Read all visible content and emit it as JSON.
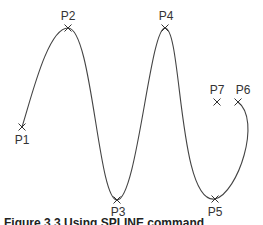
{
  "figure": {
    "caption": "Figure 3.3  Using SPLINE command",
    "curve_color": "#444444",
    "marker_color": "#333333",
    "points": [
      {
        "label": "P1",
        "x": 22,
        "y": 127,
        "lx": 22,
        "ly": 144
      },
      {
        "label": "P2",
        "x": 68,
        "y": 28,
        "lx": 68,
        "ly": 20
      },
      {
        "label": "P3",
        "x": 117,
        "y": 200,
        "lx": 118,
        "ly": 216
      },
      {
        "label": "P4",
        "x": 165,
        "y": 28,
        "lx": 166,
        "ly": 20
      },
      {
        "label": "P5",
        "x": 215,
        "y": 199,
        "lx": 215,
        "ly": 216
      },
      {
        "label": "P6",
        "x": 238,
        "y": 102,
        "lx": 243,
        "ly": 94
      },
      {
        "label": "P7",
        "x": 217,
        "y": 102,
        "lx": 217,
        "ly": 94
      }
    ]
  }
}
